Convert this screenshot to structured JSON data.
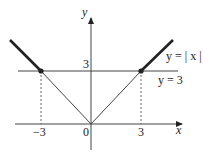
{
  "diagram": {
    "axes": {
      "x_label": "x",
      "y_label": "y",
      "origin_label": "0"
    },
    "ticks": {
      "x_neg": "−3",
      "x_pos": "3",
      "y": "3"
    },
    "curves": {
      "abs": "y = | x |",
      "horizontal": "y = 3"
    },
    "colors": {
      "line": "#222222",
      "background": "#ffffff"
    }
  }
}
